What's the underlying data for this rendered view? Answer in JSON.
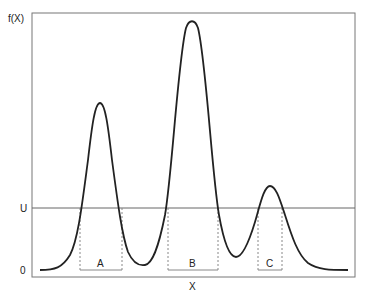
{
  "diagram": {
    "y_axis_label": "f(X)",
    "x_axis_label": "X",
    "threshold_label": "U",
    "zero_label": "0",
    "regions": [
      {
        "label": "A"
      },
      {
        "label": "B"
      },
      {
        "label": "C"
      }
    ],
    "colors": {
      "curve": "#222222",
      "frame": "#777777",
      "threshold": "#666666",
      "dotted": "#888888"
    }
  }
}
